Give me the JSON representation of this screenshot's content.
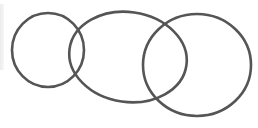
{
  "diagram": {
    "type": "overlapping-circles",
    "background": "#ffffff",
    "stroke_color": "#555555",
    "stroke_width": 2.6,
    "shapes": [
      {
        "id": "circle-left",
        "cx": 48,
        "cy": 50,
        "rx": 36,
        "ry": 37,
        "rotate": 0
      },
      {
        "id": "circle-middle",
        "cx": 128,
        "cy": 57,
        "rx": 59,
        "ry": 45,
        "rotate": 8
      },
      {
        "id": "circle-right",
        "cx": 197,
        "cy": 65,
        "rx": 54,
        "ry": 51,
        "rotate": 0
      }
    ],
    "labels": []
  }
}
